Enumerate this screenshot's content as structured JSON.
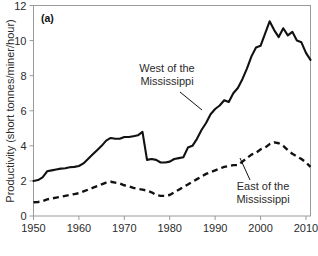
{
  "figure": {
    "panel_label": "(a)",
    "background_color": "#ffffff",
    "line_color": "#111111",
    "axis_color": "#9a9a9a"
  },
  "chart_data": {
    "type": "line",
    "title": "",
    "xlabel": "",
    "ylabel": "Productivity (short tonnes/miner/hour)",
    "xlim": [
      1950,
      2011
    ],
    "ylim": [
      0,
      12
    ],
    "xticks": [
      1950,
      1960,
      1970,
      1980,
      1990,
      2000,
      2010
    ],
    "xtick_labels": [
      "1950",
      "1960",
      "1970",
      "1980",
      "1990",
      "2000",
      "2010"
    ],
    "yticks": [
      0,
      2,
      4,
      6,
      8,
      10,
      12
    ],
    "ytick_labels": [
      "0",
      "2",
      "4",
      "6",
      "8",
      "10",
      "12"
    ],
    "grid": false,
    "legend_position": "inline-annotations",
    "annotations": [
      {
        "name": "west-of-the-mississippi",
        "text_line1": "West of the",
        "text_line2": "Mississippi",
        "text": "West of the Mississippi"
      },
      {
        "name": "east-of-the-mississippi",
        "text_line1": "East of the",
        "text_line2": "Mississippi",
        "text": "East of the Mississippi"
      }
    ],
    "x": [
      1950,
      1951,
      1952,
      1953,
      1954,
      1955,
      1956,
      1957,
      1958,
      1959,
      1960,
      1961,
      1962,
      1963,
      1964,
      1965,
      1966,
      1967,
      1968,
      1969,
      1970,
      1971,
      1972,
      1973,
      1974,
      1975,
      1976,
      1977,
      1978,
      1979,
      1980,
      1981,
      1982,
      1983,
      1984,
      1985,
      1986,
      1987,
      1988,
      1989,
      1990,
      1991,
      1992,
      1993,
      1994,
      1995,
      1996,
      1997,
      1998,
      1999,
      2000,
      2001,
      2002,
      2003,
      2004,
      2005,
      2006,
      2007,
      2008,
      2009,
      2010,
      2011
    ],
    "series": [
      {
        "name": "West of the Mississippi",
        "style": "solid",
        "values": [
          2.0,
          2.05,
          2.2,
          2.55,
          2.6,
          2.65,
          2.7,
          2.72,
          2.78,
          2.8,
          2.85,
          3.0,
          3.25,
          3.5,
          3.75,
          4.0,
          4.3,
          4.45,
          4.4,
          4.4,
          4.5,
          4.5,
          4.55,
          4.6,
          4.8,
          3.2,
          3.25,
          3.2,
          3.05,
          3.05,
          3.1,
          3.25,
          3.3,
          3.35,
          3.9,
          4.0,
          4.4,
          4.9,
          5.3,
          5.8,
          6.1,
          6.3,
          6.6,
          6.5,
          7.0,
          7.3,
          7.8,
          8.4,
          9.1,
          9.6,
          9.7,
          10.4,
          11.1,
          10.6,
          10.2,
          10.7,
          10.3,
          10.5,
          10.0,
          9.9,
          9.3,
          8.9
        ]
      },
      {
        "name": "East of the Mississippi",
        "style": "dashed",
        "values": [
          0.78,
          0.8,
          0.85,
          0.95,
          1.0,
          1.05,
          1.1,
          1.15,
          1.2,
          1.25,
          1.3,
          1.4,
          1.5,
          1.6,
          1.7,
          1.8,
          1.9,
          1.95,
          1.9,
          1.85,
          1.75,
          1.7,
          1.6,
          1.55,
          1.5,
          1.45,
          1.35,
          1.2,
          1.15,
          1.15,
          1.2,
          1.35,
          1.5,
          1.65,
          1.8,
          1.95,
          2.1,
          2.25,
          2.4,
          2.5,
          2.6,
          2.7,
          2.8,
          2.85,
          2.9,
          2.9,
          3.1,
          3.3,
          3.5,
          3.6,
          3.8,
          3.9,
          4.1,
          4.2,
          4.15,
          4.0,
          3.75,
          3.55,
          3.4,
          3.25,
          3.05,
          2.8
        ]
      }
    ]
  }
}
